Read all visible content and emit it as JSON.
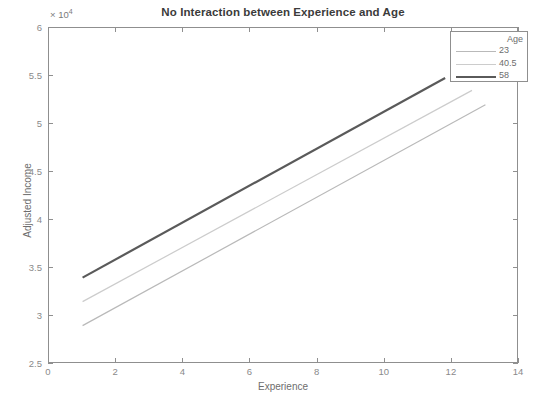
{
  "chart_data": {
    "type": "line",
    "title": "No Interaction between Experience and Age",
    "xlabel": "Experience",
    "ylabel": "Adjusted Income",
    "y_multiplier": "10",
    "y_multiplier_exp": "4",
    "y_multiplier_label": "× 10⁴",
    "xlim": [
      0,
      14
    ],
    "ylim": [
      25000,
      60000
    ],
    "xticks": [
      0,
      2,
      4,
      6,
      8,
      10,
      12,
      14
    ],
    "xtick_labels": [
      "0",
      "2",
      "4",
      "6",
      "8",
      "10",
      "12",
      "14"
    ],
    "yticks": [
      25000,
      30000,
      35000,
      40000,
      45000,
      50000,
      55000,
      60000
    ],
    "ytick_labels": [
      "2.5",
      "3",
      "3.5",
      "4",
      "4.5",
      "5",
      "5.5",
      "6"
    ],
    "grid": false,
    "legend_position": "top-right",
    "legend_title": "Age",
    "series": [
      {
        "name": "23",
        "color": "#b9b9b9",
        "width": 1.2,
        "x": [
          1,
          13
        ],
        "values": [
          29000,
          52000
        ]
      },
      {
        "name": "40.5",
        "color": "#cccccc",
        "width": 1.2,
        "x": [
          1,
          12.6
        ],
        "values": [
          31500,
          53500
        ]
      },
      {
        "name": "58",
        "color": "#5a5a5a",
        "width": 2.2,
        "x": [
          1,
          11.8
        ],
        "values": [
          34000,
          54800
        ]
      }
    ]
  },
  "legend": {
    "title": "Age",
    "entries": [
      {
        "label": "23",
        "color": "#b9b9b9",
        "width": 1.2
      },
      {
        "label": "40.5",
        "color": "#cccccc",
        "width": 1.2
      },
      {
        "label": "58",
        "color": "#5a5a5a",
        "width": 2.2
      }
    ]
  },
  "axes": {
    "frame_color": "#8f8f8f",
    "tick_color": "#8a8a8a"
  }
}
